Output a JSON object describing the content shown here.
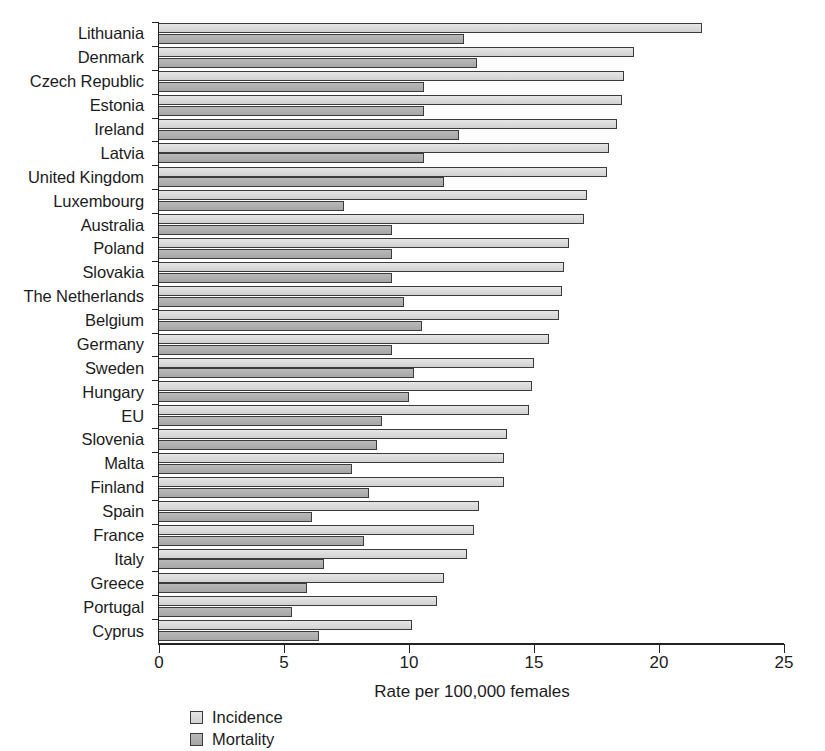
{
  "chart_data": {
    "type": "bar",
    "orientation": "horizontal",
    "title": "",
    "xlabel": "Rate per 100,000 females",
    "ylabel": "",
    "xlim": [
      0,
      25
    ],
    "xticks": [
      0,
      5,
      10,
      15,
      20,
      25
    ],
    "xtick_labels": [
      "0",
      "5",
      "10",
      "15",
      "20",
      "25"
    ],
    "grid": false,
    "legend_position": "bottom-left",
    "legend": [
      "Incidence",
      "Mortality"
    ],
    "categories": [
      "Lithuania",
      "Denmark",
      "Czech Republic",
      "Estonia",
      "Ireland",
      "Latvia",
      "United Kingdom",
      "Luxembourg",
      "Australia",
      "Poland",
      "Slovakia",
      "The Netherlands",
      "Belgium",
      "Germany",
      "Sweden",
      "Hungary",
      "EU",
      "Slovenia",
      "Malta",
      "Finland",
      "Spain",
      "France",
      "Italy",
      "Greece",
      "Portugal",
      "Cyprus"
    ],
    "series": [
      {
        "name": "Incidence",
        "color": "#dcdcdc",
        "values": [
          21.7,
          19.0,
          18.6,
          18.5,
          18.3,
          18.0,
          17.9,
          17.1,
          17.0,
          16.4,
          16.2,
          16.1,
          16.0,
          15.6,
          15.0,
          14.9,
          14.8,
          13.9,
          13.8,
          13.8,
          12.8,
          12.6,
          12.3,
          11.4,
          11.1,
          10.1
        ]
      },
      {
        "name": "Mortality",
        "color": "#b0b0b0",
        "values": [
          12.2,
          12.7,
          10.6,
          10.6,
          12.0,
          10.6,
          11.4,
          7.4,
          9.3,
          9.3,
          9.3,
          9.8,
          10.5,
          9.3,
          10.2,
          10.0,
          8.9,
          8.7,
          7.7,
          8.4,
          6.1,
          8.2,
          6.6,
          5.9,
          5.3,
          6.4
        ]
      }
    ]
  },
  "axis": {
    "x_title": "Rate per 100,000 females"
  },
  "legend": {
    "items": [
      {
        "label": "Incidence",
        "key": "incidence"
      },
      {
        "label": "Mortality",
        "key": "mortality"
      }
    ]
  }
}
